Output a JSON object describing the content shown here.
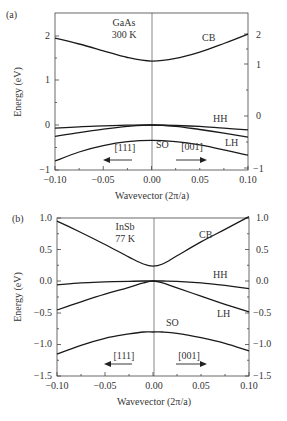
{
  "chart_data": [
    {
      "panel_label": "(a)",
      "type": "line",
      "title": "",
      "annotation": [
        "GaAs",
        "300 K"
      ],
      "xlabel": "Wavevector (2π/a)",
      "ylabel": "Energy (eV)",
      "xlim": [
        -0.1,
        0.1
      ],
      "ylim": [
        -1,
        2.5
      ],
      "x_ticks": [
        "-0.10",
        "-0.05",
        "0.00",
        "0.05",
        "0.10"
      ],
      "y_ticks_left": [
        "-1",
        "0",
        "1",
        "2"
      ],
      "y_ticks_right": [
        "-1",
        "0",
        "1",
        "2"
      ],
      "direction_labels": {
        "left": "[111]",
        "right": "[001]"
      },
      "grid": false,
      "x": [
        -0.1,
        -0.075,
        -0.05,
        -0.025,
        0.0,
        0.025,
        0.05,
        0.075,
        0.1
      ],
      "series": [
        {
          "name": "CB",
          "values": [
            1.93,
            1.8,
            1.65,
            1.5,
            1.42,
            1.48,
            1.62,
            1.81,
            2.02
          ]
        },
        {
          "name": "HH",
          "values": [
            -0.07,
            -0.04,
            -0.02,
            -0.005,
            0.0,
            -0.01,
            -0.03,
            -0.07,
            -0.11
          ]
        },
        {
          "name": "LH",
          "values": [
            -0.25,
            -0.17,
            -0.09,
            -0.03,
            0.0,
            -0.03,
            -0.1,
            -0.18,
            -0.27
          ]
        },
        {
          "name": "SO",
          "values": [
            -0.8,
            -0.6,
            -0.46,
            -0.37,
            -0.34,
            -0.37,
            -0.44,
            -0.55,
            -0.67
          ]
        }
      ]
    },
    {
      "panel_label": "(b)",
      "type": "line",
      "title": "",
      "annotation": [
        "InSb",
        "77 K"
      ],
      "xlabel": "Wavevector (2π/a)",
      "ylabel": "Energy (eV)",
      "xlim": [
        -0.1,
        0.1
      ],
      "ylim": [
        -1.5,
        1.0
      ],
      "x_ticks": [
        "-0.10",
        "-0.05",
        "0.00",
        "0.05",
        "0.10"
      ],
      "y_ticks_left": [
        "-1.5",
        "-1.0",
        "-0.5",
        "0.0",
        "0.5",
        "1.0"
      ],
      "y_ticks_right": [
        "-1.5",
        "-1.0",
        "-0.5",
        "0.0",
        "0.5",
        "1.0"
      ],
      "direction_labels": {
        "left": "[111]",
        "right": "[001]"
      },
      "grid": false,
      "x": [
        -0.1,
        -0.075,
        -0.05,
        -0.025,
        -0.01,
        0.0,
        0.01,
        0.025,
        0.05,
        0.075,
        0.1
      ],
      "series": [
        {
          "name": "CB",
          "values": [
            0.95,
            0.77,
            0.58,
            0.38,
            0.27,
            0.235,
            0.27,
            0.4,
            0.62,
            0.82,
            1.02
          ]
        },
        {
          "name": "HH",
          "values": [
            -0.06,
            -0.03,
            -0.015,
            -0.004,
            0.0,
            0.0,
            0.0,
            -0.005,
            -0.03,
            -0.07,
            -0.12
          ]
        },
        {
          "name": "LH",
          "values": [
            -0.46,
            -0.33,
            -0.21,
            -0.1,
            -0.03,
            0.0,
            -0.03,
            -0.11,
            -0.24,
            -0.37,
            -0.49
          ]
        },
        {
          "name": "SO",
          "values": [
            -1.16,
            -1.02,
            -0.91,
            -0.84,
            -0.81,
            -0.81,
            -0.81,
            -0.83,
            -0.9,
            -0.99,
            -1.11
          ]
        }
      ]
    }
  ],
  "labels": {
    "a": {
      "panel": "(a)",
      "material": "GaAs",
      "temp": "300 K",
      "cb": "CB",
      "hh": "HH",
      "lh": "LH",
      "so": "SO",
      "dir_left": "[111]",
      "dir_right": "[001]",
      "xlabel": "Wavevector (2π/a)",
      "ylabel": "Energy (eV)",
      "xticks": [
        "−0.10",
        "−0.05",
        "0.00",
        "0.05",
        "0.10"
      ],
      "yticks_left": [
        "−1",
        "0",
        "1",
        "2"
      ],
      "yticks_right": [
        "−1",
        "0",
        "1",
        "2"
      ]
    },
    "b": {
      "panel": "(b)",
      "material": "InSb",
      "temp": "77 K",
      "cb": "CB",
      "hh": "HH",
      "lh": "LH",
      "so": "SO",
      "dir_left": "[111]",
      "dir_right": "[001]",
      "xlabel": "Wavevector (2π/a)",
      "ylabel": "Energy (eV)",
      "xticks": [
        "−0.10",
        "−0.05",
        "0.00",
        "0.05",
        "0.10"
      ],
      "yticks_left": [
        "−1.5",
        "−1.0",
        "−0.5",
        "0.0",
        "0.5",
        "1.0"
      ],
      "yticks_right": [
        "−1.5",
        "−1.0",
        "−0.5",
        "0.0",
        "0.5",
        "1.0"
      ]
    }
  }
}
